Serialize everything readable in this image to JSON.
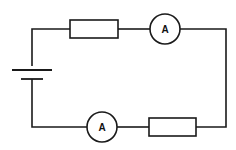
{
  "diagram": {
    "type": "circuit",
    "stroke_color": "#1a1a1a",
    "background": "#ffffff",
    "components": [
      {
        "id": "cell",
        "kind": "battery"
      },
      {
        "id": "resistor-top",
        "kind": "resistor"
      },
      {
        "id": "ammeter-top",
        "kind": "ammeter",
        "label": "A"
      },
      {
        "id": "ammeter-bottom",
        "kind": "ammeter",
        "label": "A"
      },
      {
        "id": "resistor-bottom",
        "kind": "resistor"
      }
    ]
  }
}
